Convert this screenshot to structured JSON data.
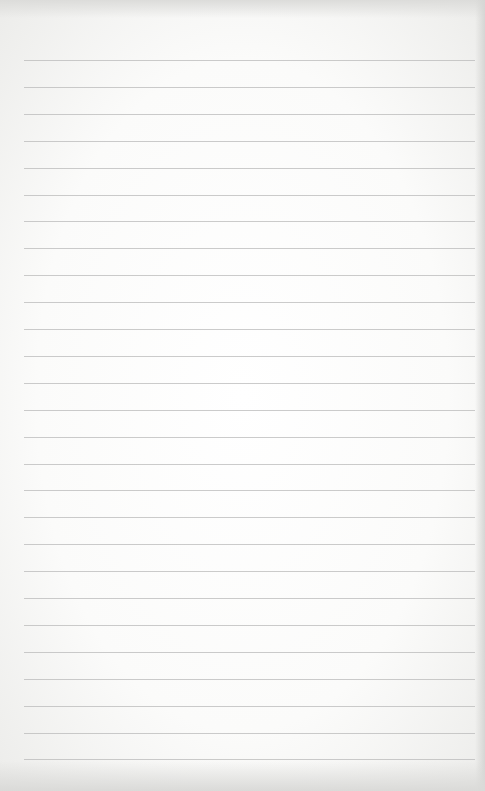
{
  "page": {
    "type": "blank lined paper",
    "background_color": "#fbfbfa",
    "line_color": "#b9b9b9",
    "line_count": 27,
    "first_line_y": 60,
    "line_spacing": 26.9,
    "line_left": 24,
    "line_right": 475
  }
}
